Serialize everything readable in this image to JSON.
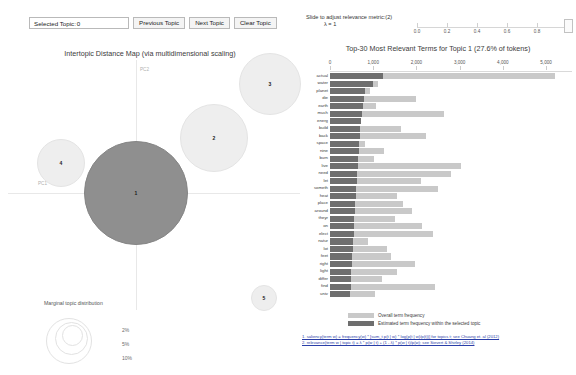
{
  "toolbar": {
    "selected_topic_label": "Selected Topic:",
    "selected_topic_value": "0",
    "previous_topic_label": "Previous Topic",
    "next_topic_label": "Next Topic",
    "clear_topic_label": "Clear Topic"
  },
  "lambda_slider": {
    "label": "Slide to adjust relevance metric:(2)",
    "value_label": "λ = 1",
    "value": 1,
    "min": 0,
    "max": 1,
    "ticks": [
      "0.0",
      "0.2",
      "0.4",
      "0.6",
      "0.8",
      "1"
    ]
  },
  "map": {
    "title": "Intertopic Distance Map (via multidimensional scaling)",
    "axis_x_label": "PC1",
    "axis_y_label": "PC2",
    "marginal_title": "Marginal topic distribution",
    "marginal_ticks": [
      "2%",
      "5%",
      "10%"
    ]
  },
  "bar_panel": {
    "title": "Top-30 Most Relevant Terms for Topic 1 (27.6% of tokens)",
    "legend_overall": "Overall term frequency",
    "legend_topic": "Estimated term frequency within the selected topic",
    "footnote_1": "1. saliency(term w) = frequency(w) * [sum_t p(t | w) * log(p(t | w)/p(t))] for topics t; see Chuang et. al (2012)",
    "footnote_2": "2. relevance(term w | topic t) = λ * p(w | t) + (1 - λ) * p(w | t)/p(w); see Sievert & Shirley (2014)"
  },
  "chart_data": {
    "type": "bar",
    "title": "Top-30 Most Relevant Terms for Topic 1 (27.6% of tokens)",
    "xlabel": "",
    "ylabel": "",
    "xlim": [
      0,
      5600
    ],
    "grid": false,
    "legend_position": "bottom-left",
    "xticks": [
      0,
      1000,
      2000,
      3000,
      4000,
      5000
    ],
    "xtick_labels": [
      "0",
      "1,000",
      "2,000",
      "3,000",
      "4,000",
      "5,000"
    ],
    "categories": [
      "actual",
      "water",
      "planet",
      "die",
      "earth",
      "much",
      "energ",
      "build",
      "back",
      "space",
      "nine",
      "burn",
      "live",
      "need",
      "let",
      "someth",
      "heat",
      "place",
      "around",
      "theyr",
      "on",
      "elect",
      "natur",
      "lot",
      "feet",
      "right",
      "light",
      "differ",
      "find",
      "univ"
    ],
    "series": [
      {
        "name": "Overall term frequency",
        "color": "#c9c9c9",
        "values": [
          5200,
          1100,
          930,
          2000,
          1060,
          2640,
          680,
          1650,
          2230,
          820,
          1240,
          1010,
          3040,
          2800,
          2100,
          2500,
          1550,
          1700,
          1900,
          1510,
          2140,
          2380,
          880,
          1330,
          1420,
          1960,
          1560,
          1210,
          2440,
          1030
        ]
      },
      {
        "name": "Estimated term frequency within the selected topic",
        "color": "#6e6e6e",
        "values": [
          1230,
          1000,
          820,
          790,
          760,
          740,
          720,
          700,
          690,
          680,
          665,
          650,
          640,
          630,
          615,
          605,
          595,
          585,
          575,
          565,
          555,
          545,
          535,
          525,
          515,
          505,
          495,
          485,
          475,
          465
        ]
      }
    ]
  },
  "topics": [
    {
      "id": "1",
      "cx": 128,
      "cy": 133,
      "r": 52,
      "selected": true
    },
    {
      "id": "2",
      "cx": 206,
      "cy": 78,
      "r": 34,
      "selected": false
    },
    {
      "id": "3",
      "cx": 262,
      "cy": 24,
      "r": 31,
      "selected": false
    },
    {
      "id": "4",
      "cx": 53,
      "cy": 103,
      "r": 24,
      "selected": false
    },
    {
      "id": "5",
      "cx": 256,
      "cy": 238,
      "r": 13,
      "selected": false
    }
  ]
}
